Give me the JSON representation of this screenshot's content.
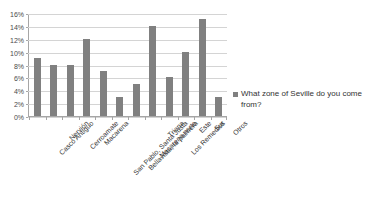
{
  "chart_data": {
    "type": "bar",
    "title": "What zone of Seville do you come from?",
    "xlabel": "",
    "ylabel": "",
    "ylim": [
      0,
      16
    ],
    "ytick_labels": [
      "16%",
      "14%",
      "12%",
      "10%",
      "8%",
      "6%",
      "4%",
      "2%",
      "0%"
    ],
    "ytick_values": [
      16,
      14,
      12,
      10,
      8,
      6,
      4,
      2,
      0
    ],
    "grid": true,
    "legend_position": "right",
    "bar_color": "#808080",
    "gridline_color": "#d4d4d4",
    "axis_color": "#a6a6a6",
    "categories": [
      "Casco Antiguo",
      "Nervión",
      "Cerroamate",
      "Macarena",
      "San Pablo, Santa Justa",
      "Bellavista, la palmera",
      "Macarena norte",
      "Triana",
      "Los Remedios",
      "Este",
      "Sur",
      "Otros"
    ],
    "values": [
      9,
      8,
      8,
      12,
      7,
      3,
      5,
      14,
      6,
      10,
      15,
      3
    ],
    "value_labels": [
      "9%",
      "8%",
      "8%",
      "12%",
      "7%",
      "3%",
      "5%",
      "14%",
      "6%",
      "10%",
      "15%",
      "3%"
    ],
    "series": [
      {
        "name": "What zone of Seville do you come from?",
        "values": [
          9,
          8,
          8,
          12,
          7,
          3,
          5,
          14,
          6,
          10,
          15,
          3
        ]
      }
    ],
    "legend": [
      "What zone of Seville do you come from?"
    ]
  }
}
